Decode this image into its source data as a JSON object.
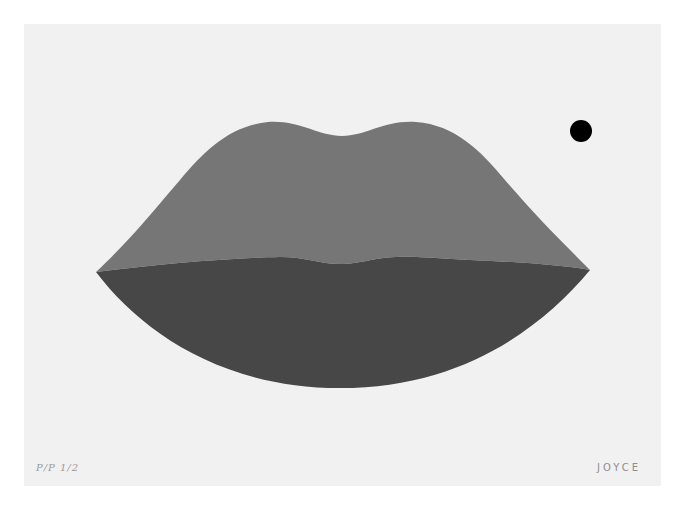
{
  "artwork": {
    "paper_color": "#f1f1f1",
    "upper_lip_color": "#767676",
    "lower_lip_color": "#474747",
    "dot_color": "#000000",
    "edition_mark": "P/P 1/2",
    "signature": "JOYCE"
  }
}
